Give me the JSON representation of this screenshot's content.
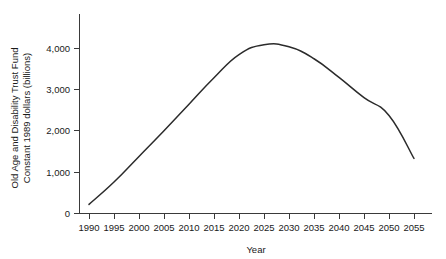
{
  "chart_data": {
    "type": "line",
    "title": "",
    "xlabel": "Year",
    "ylabel": "Old Age and Disability Trust Fund\nConstant 1989 dollars (billions)",
    "ylabel_line1": "Old Age and Disability Trust Fund",
    "ylabel_line2": "Constant 1989 dollars (billions)",
    "xlim": [
      1990,
      2055
    ],
    "ylim": [
      0,
      4500
    ],
    "grid": false,
    "legend": "none",
    "xticks": [
      1990,
      1995,
      2000,
      2005,
      2010,
      2015,
      2020,
      2025,
      2030,
      2035,
      2040,
      2045,
      2050,
      2055
    ],
    "xtick_labels": [
      "1990",
      "1995",
      "2000",
      "2005",
      "2010",
      "2015",
      "2020",
      "2025",
      "2030",
      "2035",
      "2040",
      "2045",
      "2050",
      "2055"
    ],
    "yticks": [
      0,
      1000,
      2000,
      3000,
      4000
    ],
    "ytick_labels": [
      "0",
      "1,000",
      "2,000",
      "3,000",
      "4,000"
    ],
    "line_color": "#2b2b2b",
    "x": [
      1990,
      1995,
      2000,
      2005,
      2010,
      2015,
      2020,
      2025,
      2030,
      2035,
      2040,
      2045,
      2050,
      2055
    ],
    "values": [
      220,
      760,
      1380,
      2000,
      2640,
      3280,
      3840,
      4080,
      4030,
      3740,
      3290,
      2800,
      2370,
      1330
    ],
    "series": [
      {
        "name": "Old Age and Disability Trust Fund",
        "values": [
          220,
          760,
          1380,
          2000,
          2640,
          3280,
          3840,
          4080,
          4030,
          3740,
          3290,
          2800,
          2370,
          1330
        ]
      }
    ]
  }
}
